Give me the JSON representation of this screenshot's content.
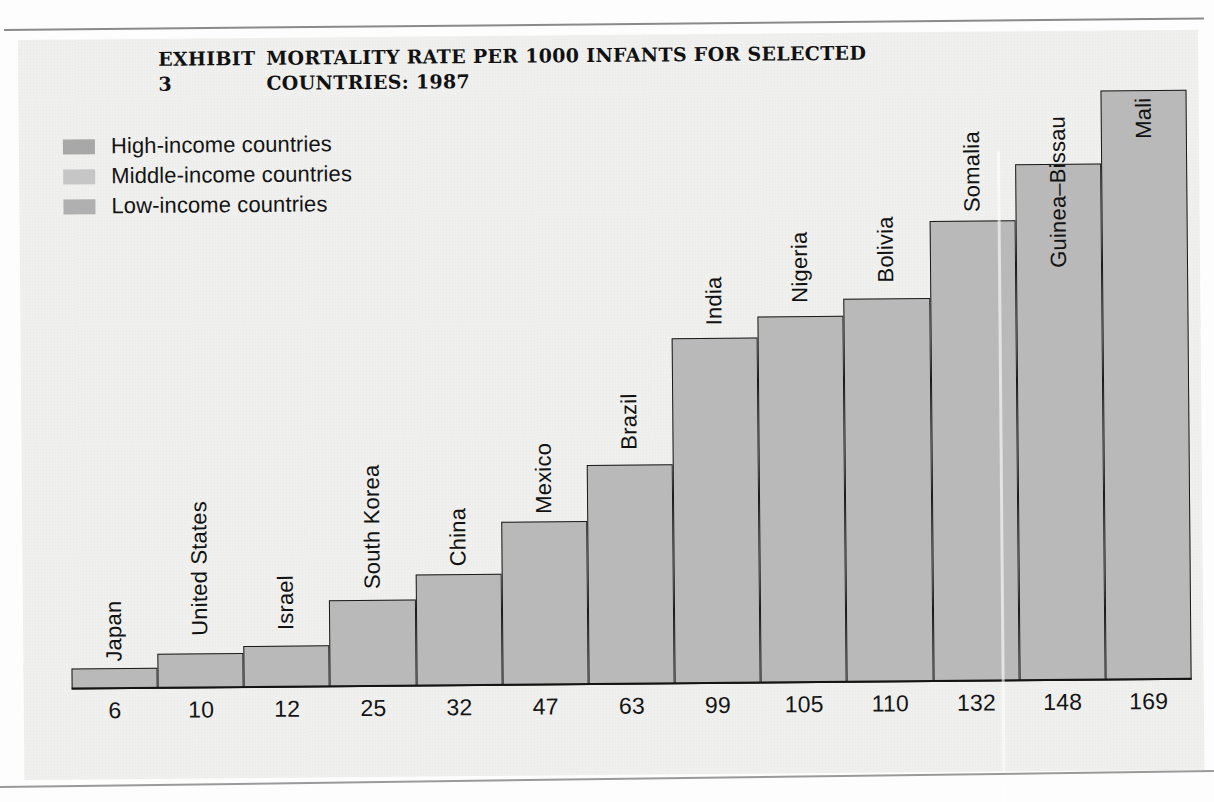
{
  "exhibit": {
    "label": "EXHIBIT 3",
    "title": "MORTALITY RATE PER 1000 INFANTS FOR SELECTED COUNTRIES: 1987"
  },
  "legend": {
    "items": [
      {
        "label": "High-income countries",
        "color": "#a8a8a8"
      },
      {
        "label": "Middle-income countries",
        "color": "#c6c6c6"
      },
      {
        "label": "Low-income countries",
        "color": "#b0b0b0"
      }
    ]
  },
  "colors": {
    "bar_fill": "#b9b9b9",
    "bar_stroke": "#1a1a1a",
    "panel_background": "#f0f0ee",
    "page_background": "#fdfdfd",
    "text": "#141414"
  },
  "chart_data": {
    "type": "bar",
    "title": "MORTALITY RATE PER 1000 INFANTS FOR SELECTED COUNTRIES: 1987",
    "subtitle": "",
    "xlabel": "",
    "ylabel": "",
    "ylim": [
      0,
      169
    ],
    "grid": false,
    "legend_position": "top-left",
    "orientation": "vertical",
    "categories": [
      "Japan",
      "United States",
      "Israel",
      "South Korea",
      "China",
      "Mexico",
      "Brazil",
      "India",
      "Nigeria",
      "Bolivia",
      "Somalia",
      "Guinea–Bissau",
      "Mali"
    ],
    "values": [
      6,
      10,
      12,
      25,
      32,
      47,
      63,
      99,
      105,
      110,
      132,
      148,
      169
    ],
    "value_labels": [
      "6",
      "10",
      "12",
      "25",
      "32",
      "47",
      "63",
      "99",
      "105",
      "110",
      "132",
      "148",
      "169"
    ],
    "groups": [
      "High-income",
      "High-income",
      "High-income",
      "Middle-income",
      "Low-income",
      "Middle-income",
      "Middle-income",
      "Low-income",
      "Low-income",
      "Middle-income",
      "Low-income",
      "Low-income",
      "Low-income"
    ],
    "bars": [
      {
        "country": "Japan",
        "value": 6,
        "label": "6",
        "label_placement": "outside"
      },
      {
        "country": "United States",
        "value": 10,
        "label": "10",
        "label_placement": "outside"
      },
      {
        "country": "Israel",
        "value": 12,
        "label": "12",
        "label_placement": "outside"
      },
      {
        "country": "South Korea",
        "value": 25,
        "label": "25",
        "label_placement": "outside"
      },
      {
        "country": "China",
        "value": 32,
        "label": "32",
        "label_placement": "outside"
      },
      {
        "country": "Mexico",
        "value": 47,
        "label": "47",
        "label_placement": "outside"
      },
      {
        "country": "Brazil",
        "value": 63,
        "label": "63",
        "label_placement": "outside"
      },
      {
        "country": "India",
        "value": 99,
        "label": "99",
        "label_placement": "outside"
      },
      {
        "country": "Nigeria",
        "value": 105,
        "label": "105",
        "label_placement": "outside"
      },
      {
        "country": "Bolivia",
        "value": 110,
        "label": "110",
        "label_placement": "outside"
      },
      {
        "country": "Somalia",
        "value": 132,
        "label": "132",
        "label_placement": "outside"
      },
      {
        "country": "Guinea–Bissau",
        "value": 148,
        "label": "148",
        "label_placement": "inside"
      },
      {
        "country": "Mali",
        "value": 169,
        "label": "169",
        "label_placement": "inside"
      }
    ]
  }
}
